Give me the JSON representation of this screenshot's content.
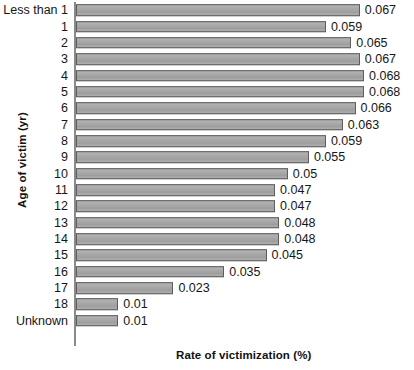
{
  "chart_data": {
    "type": "bar",
    "orientation": "horizontal",
    "title": "",
    "xlabel": "Rate of victimization (%)",
    "ylabel": "Age of victim (yr)",
    "xlim": [
      0,
      0.0725
    ],
    "grid": false,
    "legend": null,
    "categories": [
      "Less than 1",
      "1",
      "2",
      "3",
      "4",
      "5",
      "6",
      "7",
      "8",
      "9",
      "10",
      "11",
      "12",
      "13",
      "14",
      "15",
      "16",
      "17",
      "18",
      "Unknown"
    ],
    "values": [
      0.067,
      0.059,
      0.065,
      0.067,
      0.068,
      0.068,
      0.066,
      0.063,
      0.059,
      0.055,
      0.05,
      0.047,
      0.047,
      0.048,
      0.048,
      0.045,
      0.035,
      0.023,
      0.01,
      0.01
    ],
    "value_labels": [
      "0.067",
      "0.059",
      "0.065",
      "0.067",
      "0.068",
      "0.068",
      "0.066",
      "0.063",
      "0.059",
      "0.055",
      "0.05",
      "0.047",
      "0.047",
      "0.048",
      "0.048",
      "0.045",
      "0.035",
      "0.023",
      "0.01",
      "0.01"
    ],
    "colors": {
      "bar_fill": "#a8a8a8",
      "bar_outline": "#5d5d5d",
      "axis": "#8a8a8a",
      "text": "#161616",
      "background": "#ffffff"
    }
  }
}
